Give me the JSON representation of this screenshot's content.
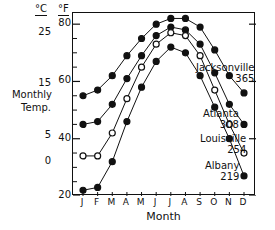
{
  "chart_data": {
    "type": "line",
    "title": "",
    "xlabel": "Month",
    "ylabel": "Monthly Temp.",
    "categories": [
      "J",
      "F",
      "M",
      "A",
      "M",
      "J",
      "J",
      "A",
      "S",
      "O",
      "N",
      "D"
    ],
    "y_axes": [
      {
        "unit": "°C",
        "ticks": [
          25,
          15,
          5,
          0
        ]
      },
      {
        "unit": "°F",
        "ticks": [
          80,
          60,
          40,
          20
        ],
        "ylim": [
          20,
          84
        ]
      }
    ],
    "grid": false,
    "legend_position": "right-inline",
    "series": [
      {
        "name": "Jacksonville",
        "value": "365",
        "marker": "filled-circle",
        "values_f": [
          55,
          57,
          62,
          69,
          75,
          80,
          82,
          82,
          79,
          71,
          62,
          56
        ]
      },
      {
        "name": "Atlanta",
        "value": "308",
        "marker": "filled-circle",
        "values_f": [
          45,
          46,
          52,
          61,
          69,
          76,
          79,
          78,
          73,
          63,
          52,
          45
        ]
      },
      {
        "name": "Louisville",
        "value": "254",
        "marker": "open-circle",
        "values_f": [
          34,
          34,
          42,
          54,
          65,
          73,
          77,
          76,
          69,
          57,
          45,
          35
        ]
      },
      {
        "name": "Albany",
        "value": "219",
        "marker": "filled-circle",
        "values_f": [
          22,
          23,
          32,
          46,
          58,
          67,
          72,
          70,
          62,
          51,
          40,
          27
        ]
      }
    ]
  },
  "axis": {
    "celsius_header": "°C",
    "fahrenheit_header": "°F",
    "celsius_ticks": [
      "25",
      "15",
      "5",
      "0"
    ],
    "fahrenheit_ticks": [
      "80",
      "60",
      "40",
      "20"
    ],
    "title_line1": "Monthly",
    "title_line2": "Temp.",
    "x_title": "Month",
    "months": [
      "J",
      "F",
      "M",
      "A",
      "M",
      "J",
      "J",
      "A",
      "S",
      "O",
      "N",
      "D"
    ]
  },
  "annotations": [
    {
      "name": "Jacksonville",
      "value": "365"
    },
    {
      "name": "Atlanta",
      "value": "308"
    },
    {
      "name": "Louisville",
      "value": "254"
    },
    {
      "name": "Albany",
      "value": "219"
    }
  ],
  "colors": {
    "ink": "#111111",
    "background": "#ffffff"
  }
}
